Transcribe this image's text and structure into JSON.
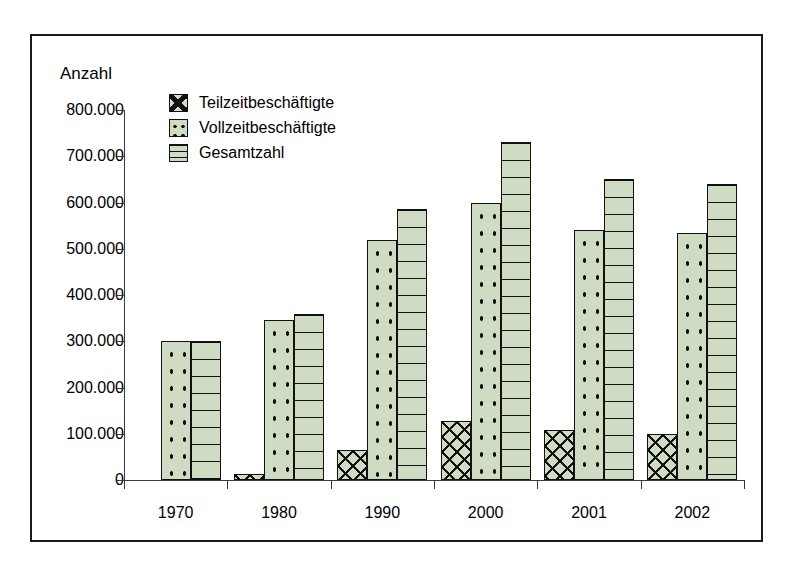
{
  "chart_data": {
    "type": "bar",
    "title": "",
    "subtitle": "",
    "ylabel": "Anzahl",
    "xlabel": "",
    "categories": [
      "1970",
      "1980",
      "1990",
      "2000",
      "2001",
      "2002"
    ],
    "series": [
      {
        "name": "Teilzeitbeschäftigte",
        "pattern": "crosshatch",
        "values": [
          0,
          13000,
          65000,
          128000,
          108000,
          100000
        ]
      },
      {
        "name": "Vollzeitbeschäftigte",
        "pattern": "dots",
        "values": [
          300000,
          345000,
          520000,
          600000,
          540000,
          533000
        ]
      },
      {
        "name": "Gesamtzahl",
        "pattern": "horizontal-lines",
        "values": [
          300000,
          358000,
          585000,
          730000,
          650000,
          640000
        ]
      }
    ],
    "ylim": [
      0,
      800000
    ],
    "ytick_values": [
      0,
      100000,
      200000,
      300000,
      400000,
      500000,
      600000,
      700000,
      800000
    ],
    "ytick_labels": [
      "0",
      "100.000",
      "200.000",
      "300.000",
      "400.000",
      "500.000",
      "600.000",
      "700.000",
      "800.000"
    ],
    "grid": false,
    "legend_position": "top-left",
    "bar_fill_color": "#cfdbc2",
    "bar_border_color": "#111111",
    "axis_color": "#3a3a3a",
    "frame_color": "#1a1a1a",
    "background_color": "#ffffff"
  },
  "legend": {
    "entries": [
      {
        "label": "Teilzeitbeschäftigte",
        "pattern": "pat-cross"
      },
      {
        "label": "Vollzeitbeschäftigte",
        "pattern": "pat-dots"
      },
      {
        "label": "Gesamtzahl",
        "pattern": "pat-hlines"
      }
    ]
  }
}
